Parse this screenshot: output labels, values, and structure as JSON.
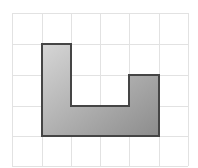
{
  "diagram": {
    "type": "grid-polygon",
    "grid": {
      "columns": 6,
      "rows": 5,
      "x_lines": [
        12,
        42,
        71,
        100,
        129,
        159,
        188
      ],
      "y_lines": [
        13,
        44,
        75,
        106,
        136,
        166
      ],
      "line_color": "#e2e2e2"
    },
    "shape": {
      "grid_vertices": [
        [
          1,
          1
        ],
        [
          2,
          1
        ],
        [
          2,
          3
        ],
        [
          4,
          3
        ],
        [
          4,
          2
        ],
        [
          5,
          2
        ],
        [
          5,
          4
        ],
        [
          1,
          4
        ]
      ],
      "points": "42,44 71,44 71,106 129,106 129,75 159,75 159,136 42,136",
      "stroke": "#454545",
      "fill_start": "#d6d6d6",
      "fill_end": "#8c8c8c"
    }
  }
}
